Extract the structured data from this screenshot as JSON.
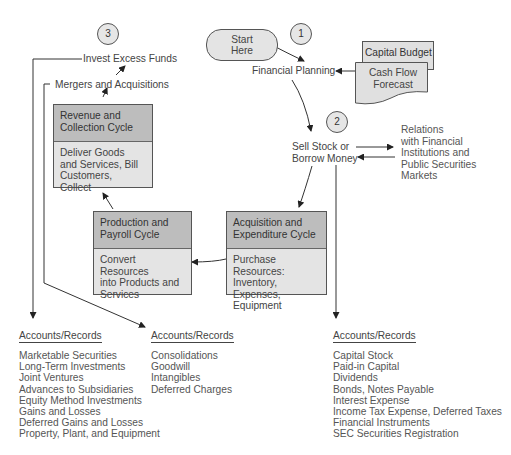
{
  "diagram": {
    "start": {
      "line1": "Start",
      "line2": "Here"
    },
    "steps": [
      {
        "number": "1",
        "label": "Financial Planning"
      },
      {
        "number": "2",
        "label_line1": "Sell Stock or",
        "label_line2": "Borrow Money"
      },
      {
        "number": "3",
        "label": "Invest Excess Funds"
      }
    ],
    "mergers": "Mergers and Acquisitions",
    "documents": {
      "capital_budget": "Capital Budget",
      "cash_flow_line1": "Cash Flow",
      "cash_flow_line2": "Forecast"
    },
    "relations": [
      "Relations",
      "with Financial",
      "Institutions and",
      "Public Securities",
      "Markets"
    ],
    "cycles": {
      "revenue": {
        "title_line1": "Revenue and",
        "title_line2": "Collection Cycle",
        "body_line1": "Deliver Goods",
        "body_line2": "and Services, Bill",
        "body_line3": "Customers, Collect"
      },
      "production": {
        "title_line1": "Production and",
        "title_line2": "Payroll Cycle",
        "body_line1": "Convert Resources",
        "body_line2": "into Products and",
        "body_line3": "Services"
      },
      "acquisition": {
        "title_line1": "Acquisition and",
        "title_line2": "Expenditure Cycle",
        "body_line1": "Purchase Resources:",
        "body_line2": "Inventory, Expenses,",
        "body_line3": "Equipment"
      }
    },
    "accounts": {
      "left": {
        "title": "Accounts/Records",
        "items": [
          "Marketable Securities",
          "Long-Term Investments",
          "Joint Ventures",
          "Advances to Subsidiaries",
          "Equity Method Investments",
          "Gains and Losses",
          "Deferred Gains and Losses",
          "Property, Plant, and Equipment"
        ]
      },
      "middle": {
        "title": "Accounts/Records",
        "items": [
          "Consolidations",
          "Goodwill",
          "Intangibles",
          "Deferred Charges"
        ]
      },
      "right": {
        "title": "Accounts/Records",
        "items": [
          "Capital Stock",
          "Paid-in Capital",
          "Dividends",
          "Bonds, Notes Payable",
          "Interest Expense",
          "Income Tax Expense, Deferred Taxes",
          "Financial Instruments",
          "SEC Securities Registration"
        ]
      }
    },
    "colors": {
      "box_fill": "#e4e4e4",
      "header_fill": "#bdbdbd",
      "line": "#333333"
    }
  }
}
